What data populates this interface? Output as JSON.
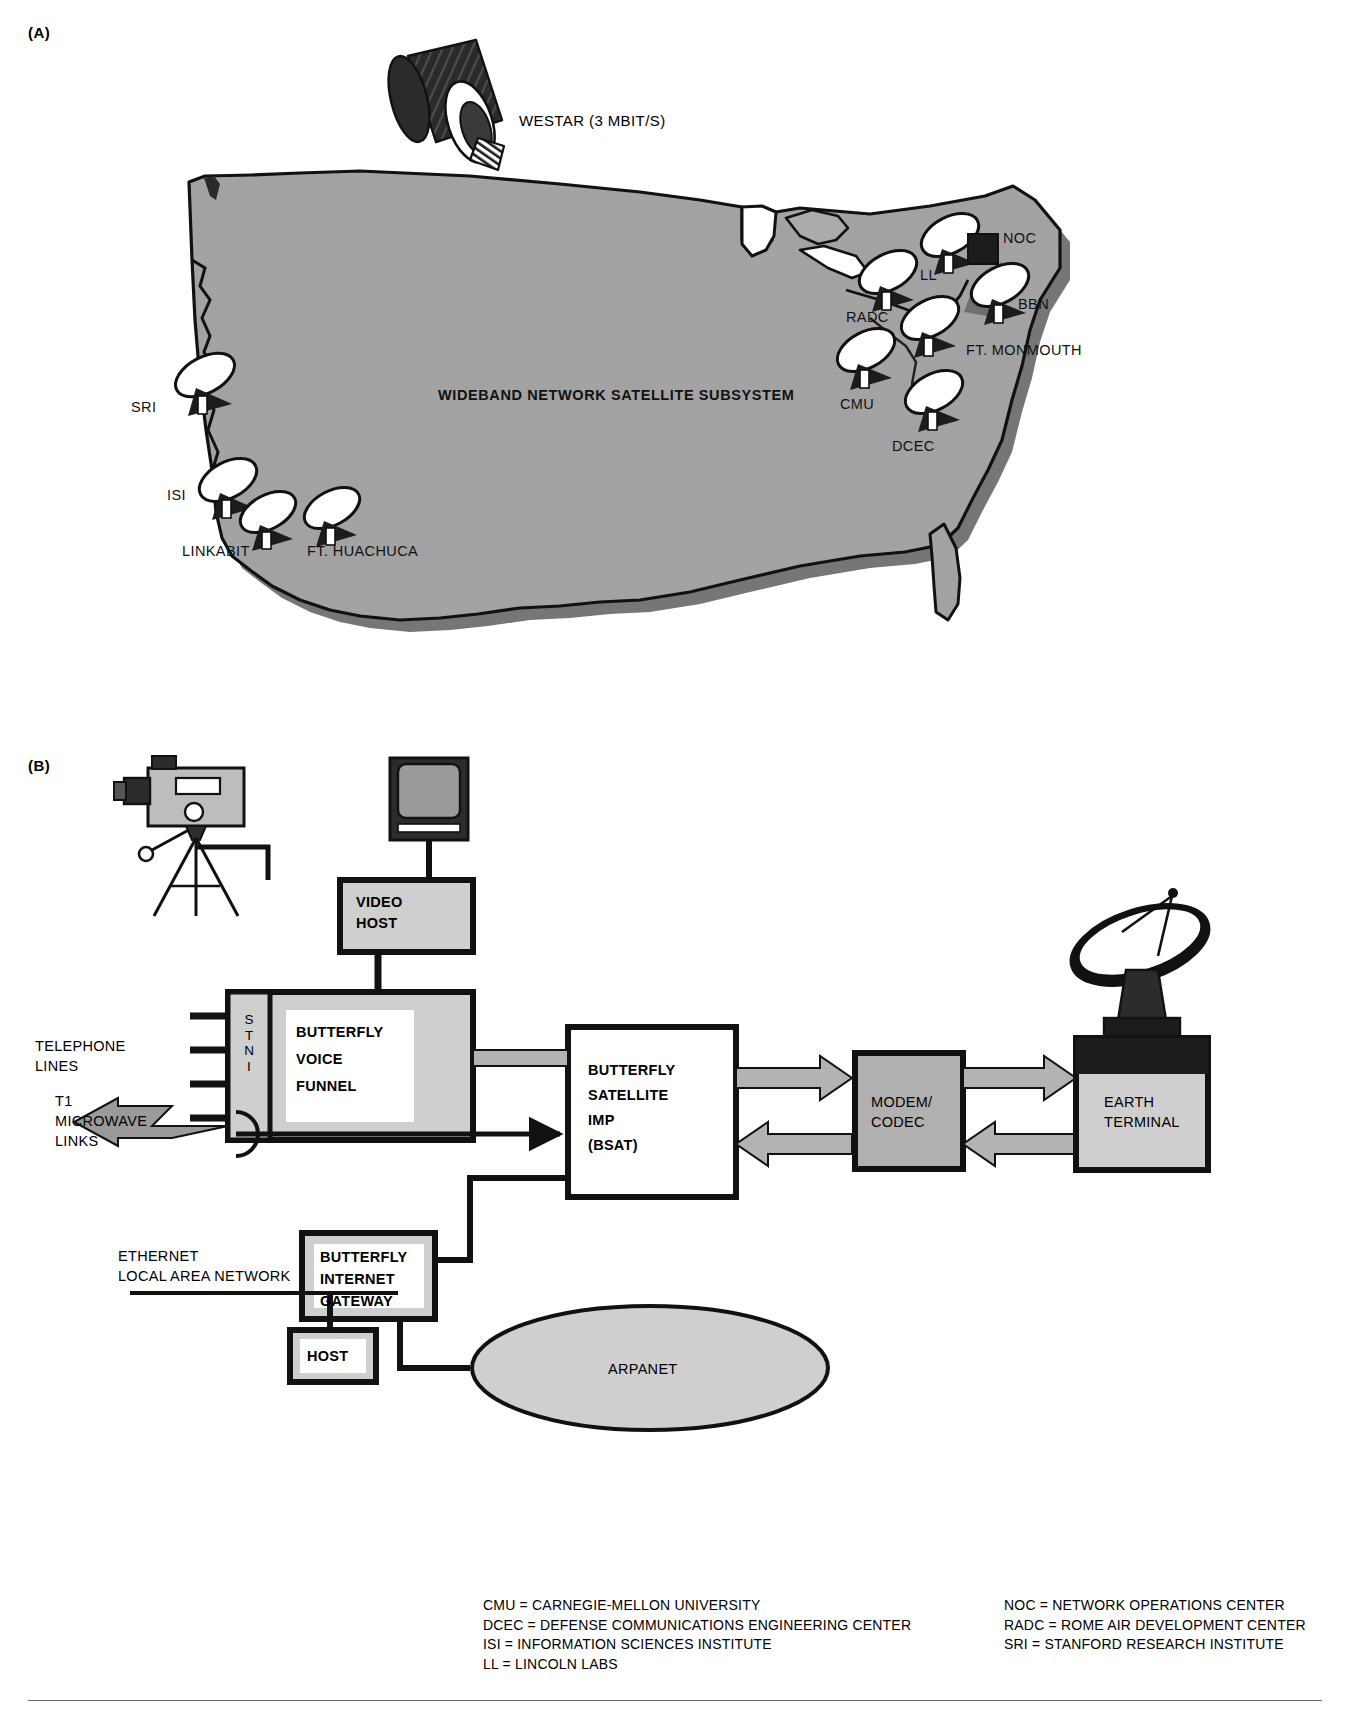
{
  "figure": {
    "panel_a_letter": "(A)",
    "panel_b_letter": "(B)"
  },
  "panel_a": {
    "title": "WIDEBAND NETWORK SATELLITE SUBSYSTEM",
    "satellite_label": "WESTAR (3 MBIT/S)",
    "sites": [
      {
        "id": "sri",
        "label": "SRI"
      },
      {
        "id": "isi",
        "label": "ISI"
      },
      {
        "id": "linkabit",
        "label": "LINKABIT"
      },
      {
        "id": "ft-huachuca",
        "label": "FT. HUACHUCA"
      },
      {
        "id": "radc",
        "label": "RADC"
      },
      {
        "id": "ll",
        "label": "LL"
      },
      {
        "id": "noc",
        "label": "NOC"
      },
      {
        "id": "bbn",
        "label": "BBN"
      },
      {
        "id": "ft-monmouth",
        "label": "FT. MONMOUTH"
      },
      {
        "id": "cmu",
        "label": "CMU"
      },
      {
        "id": "dcec",
        "label": "DCEC"
      }
    ]
  },
  "panel_b": {
    "boxes": {
      "video_host": "VIDEO\nHOST",
      "video_host_line1": "VIDEO",
      "video_host_line2": "HOST",
      "stni": "STNI",
      "stni_letters": [
        "S",
        "T",
        "N",
        "I"
      ],
      "voice_funnel_line1": "BUTTERFLY",
      "voice_funnel_line2": "VOICE",
      "voice_funnel_line3": "FUNNEL",
      "bsat_line1": "BUTTERFLY",
      "bsat_line2": "SATELLITE",
      "bsat_line3": "IMP",
      "bsat_line4": "(BSAT)",
      "modem_line1": "MODEM/",
      "modem_line2": "CODEC",
      "earth_line1": "EARTH",
      "earth_line2": "TERMINAL",
      "gateway_line1": "BUTTERFLY",
      "gateway_line2": "INTERNET",
      "gateway_line3": "GATEWAY",
      "host": "HOST",
      "arpanet": "ARPANET"
    },
    "labels": {
      "telephone_line1": "TELEPHONE",
      "telephone_line2": "LINES",
      "t1_line1": "T1",
      "t1_line2": "MICROWAVE",
      "t1_line3": "LINKS",
      "ethernet_line1": "ETHERNET",
      "ethernet_line2": "LOCAL AREA NETWORK"
    }
  },
  "legend": {
    "left_column": [
      "CMU  = CARNEGIE-MELLON UNIVERSITY",
      "DCEC = DEFENSE COMMUNICATIONS ENGINEERING CENTER",
      "ISI  = INFORMATION SCIENCES INSTITUTE",
      "LL   = LINCOLN LABS"
    ],
    "right_column": [
      "NOC  = NETWORK OPERATIONS CENTER",
      "RADC = ROME AIR DEVELOPMENT CENTER",
      "SRI  = STANFORD RESEARCH INSTITUTE"
    ]
  },
  "colors": {
    "map_fill": "#a9a9a9",
    "map_edge": "#7a7a7a",
    "box_fill": "#cfcfcf",
    "box_inner": "#ffffff",
    "ink": "#111111",
    "arrow_fill": "#b3b3b3",
    "screen_fill": "#9a9a9a"
  }
}
